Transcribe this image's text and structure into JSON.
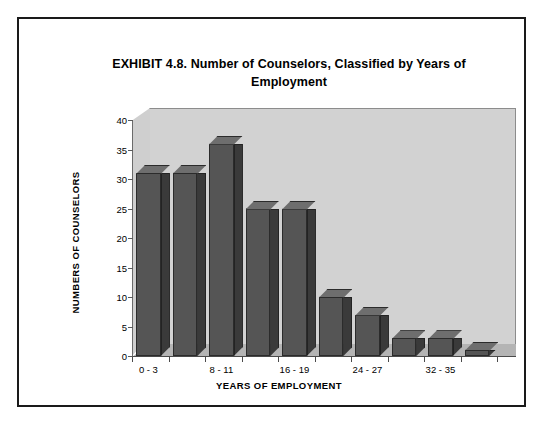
{
  "document": {
    "border_color": "#1a1a1a"
  },
  "chart_data": {
    "type": "bar",
    "title": "EXHIBIT 4.8.  Number of Counselors, Classified by Years of Employment",
    "title_line1": "EXHIBIT 4.8.  Number of Counselors, Classified by Years of",
    "title_line2": "Employment",
    "xlabel": "YEARS OF EMPLOYMENT",
    "ylabel": "NUMBERS OF COUNSELORS",
    "categories": [
      "0 - 3",
      "4 - 7",
      "8 - 11",
      "12 - 15",
      "16 - 19",
      "20 - 23",
      "24 - 27",
      "28 - 31",
      "32 - 35",
      "36 - 39"
    ],
    "visible_tick_labels": [
      "0 - 3",
      "8 - 11",
      "16 - 19",
      "24 - 27",
      "32 - 35"
    ],
    "values": [
      31,
      31,
      36,
      25,
      25,
      10,
      7,
      3,
      3,
      1
    ],
    "ylim": [
      0,
      40
    ],
    "yticks": [
      0,
      5,
      10,
      15,
      20,
      25,
      30,
      35,
      40
    ],
    "ytick_labels": [
      "0",
      "5",
      "10",
      "15",
      "20",
      "25",
      "30",
      "35",
      "40"
    ],
    "grid": false,
    "legend": "none",
    "style": "3d-column",
    "colors": {
      "bar_front": "#555555",
      "bar_side": "#3a3a3a",
      "bar_top": "#6e6e6e",
      "plot_background": "#d2d2d2",
      "floor": "#b4b4b4",
      "text": "#000000"
    }
  }
}
